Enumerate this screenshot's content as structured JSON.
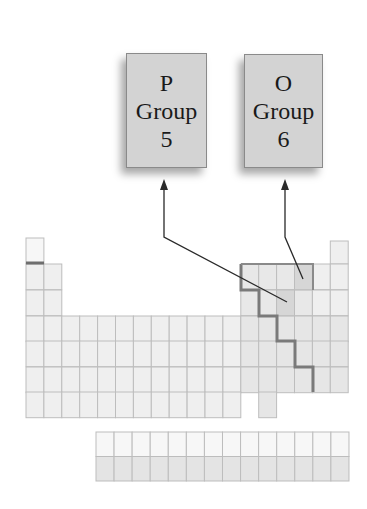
{
  "diagram": {
    "boxes": [
      {
        "id": "phosphorus",
        "symbol": "P",
        "group_label": "Group",
        "group_number": "5",
        "x": 126,
        "y": 53,
        "w": 81,
        "h": 115
      },
      {
        "id": "oxygen",
        "symbol": "O",
        "group_label": "Group",
        "group_number": "6",
        "x": 244,
        "y": 54,
        "w": 79,
        "h": 114
      }
    ],
    "colors": {
      "box_fill": "#d3d3d3",
      "box_border": "#8a8a8a",
      "cell_fill": "#efefef",
      "cell_fill_light": "#f7f7f7",
      "cell_border": "#bdbdbd",
      "highlight_cell": "#d6d6d6",
      "staircase": "#7a7a7a",
      "arrow": "#2a2a2a"
    }
  }
}
